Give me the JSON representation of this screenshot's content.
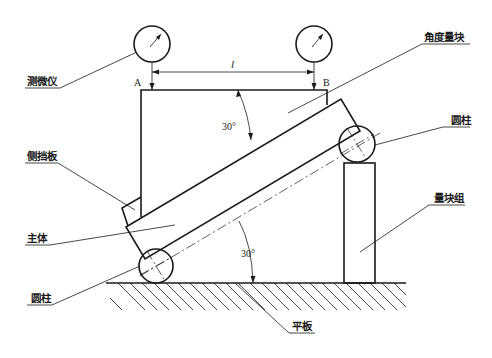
{
  "diagram": {
    "type": "sine-bar angle gauge block calibration setup",
    "labels": {
      "micrometer": "测微仪",
      "side_plate": "侧挡板",
      "main_body": "主体",
      "cylinder_left": "圆柱",
      "angle_gauge_block": "角度量块",
      "cylinder_right": "圆柱",
      "gauge_block_stack": "量块组",
      "surface_plate": "平板"
    },
    "points": {
      "a": "A",
      "b": "B"
    },
    "dimensions": {
      "length_symbol": "l",
      "upper_angle": "30°",
      "lower_angle": "30°"
    },
    "colors": {
      "line": "#1a1a1a",
      "background": "#ffffff"
    }
  }
}
